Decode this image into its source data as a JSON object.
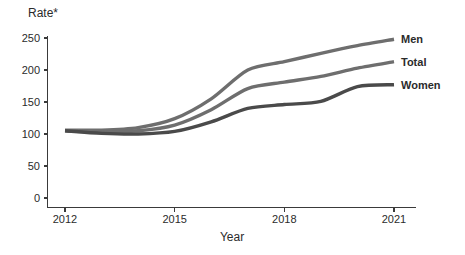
{
  "chart_data": {
    "type": "line",
    "title": "",
    "xlabel": "Year",
    "ylabel": "Rate*",
    "x": [
      2012,
      2013,
      2014,
      2015,
      2016,
      2017,
      2018,
      2019,
      2020,
      2021
    ],
    "xticks": [
      "2012",
      "2015",
      "2018",
      "2021"
    ],
    "xtick_values": [
      2012,
      2015,
      2018,
      2021
    ],
    "xlim": [
      2012,
      2021
    ],
    "yticks": [
      "0",
      "50",
      "100",
      "150",
      "200",
      "250"
    ],
    "ytick_values": [
      0,
      50,
      100,
      150,
      200,
      250
    ],
    "ylim": [
      0,
      258
    ],
    "grid": false,
    "legend_position": "right-inline",
    "series": [
      {
        "name": "Men",
        "color": "#6e6e6e",
        "values": [
          106,
          106,
          110,
          124,
          155,
          200,
          213,
          226,
          238,
          248
        ]
      },
      {
        "name": "Total",
        "color": "#6e6e6e",
        "values": [
          105,
          103,
          105,
          114,
          138,
          171,
          181,
          190,
          203,
          213
        ]
      },
      {
        "name": "Women",
        "color": "#4a4a4a",
        "values": [
          105,
          101,
          100,
          104,
          119,
          140,
          146,
          151,
          174,
          177
        ]
      }
    ]
  },
  "axes": {
    "y_label": "Rate*",
    "x_label": "Year"
  },
  "legend": {
    "men_label": "Men",
    "total_label": "Total",
    "women_label": "Women"
  }
}
